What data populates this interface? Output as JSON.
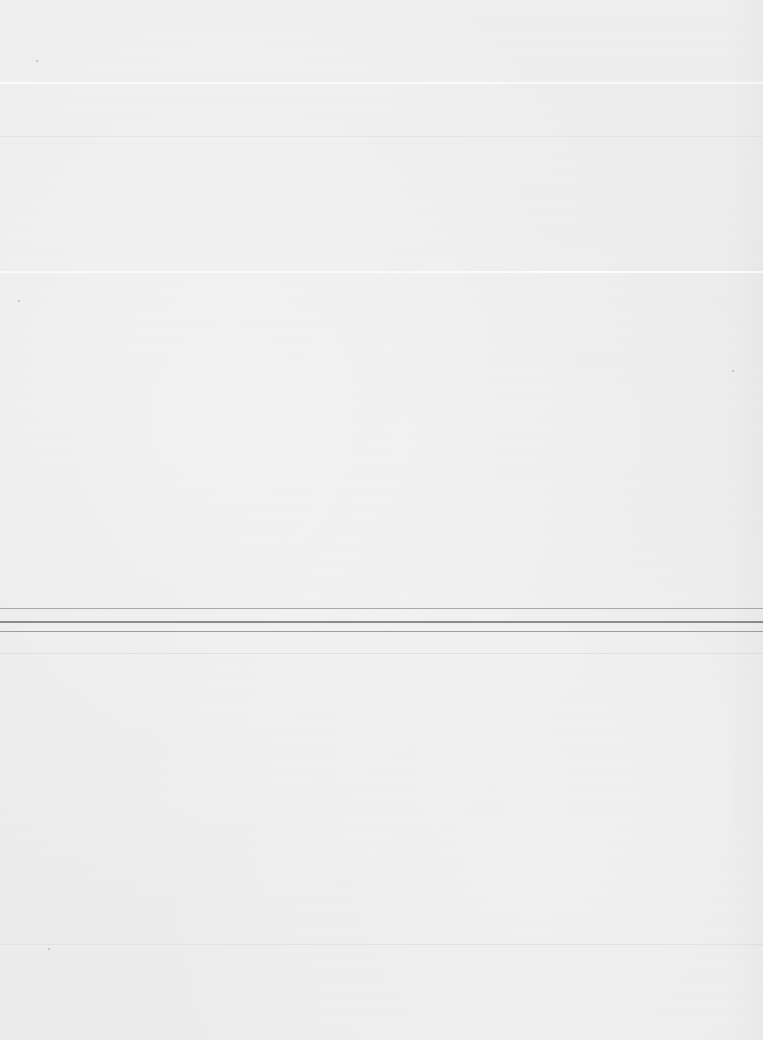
{
  "document": {
    "type": "blank scanned page",
    "background_color": "#ececec",
    "rules": [
      {
        "y": 82,
        "color": "#fafafa",
        "thickness": 2
      },
      {
        "y": 136,
        "color": "#e4e4e4",
        "thickness": 1
      },
      {
        "y": 271,
        "color": "#fbfbfb",
        "thickness": 2
      },
      {
        "y": 608,
        "color": "#a9a9a9",
        "thickness": 1
      },
      {
        "y": 621,
        "color": "#8c8c8c",
        "thickness": 2
      },
      {
        "y": 631,
        "color": "#9e9e9e",
        "thickness": 1
      },
      {
        "y": 653,
        "color": "#e0e0e0",
        "thickness": 1
      },
      {
        "y": 944,
        "color": "#e2e2e2",
        "thickness": 1
      }
    ]
  }
}
